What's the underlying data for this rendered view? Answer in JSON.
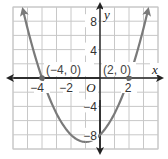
{
  "chart_data": {
    "type": "line",
    "title": "",
    "xlabel": "x",
    "ylabel": "y",
    "xlim": [
      -6,
      4
    ],
    "ylim": [
      -10,
      10
    ],
    "grid": true,
    "grid_step": {
      "x": 1,
      "y": 2
    },
    "x_ticks": [
      {
        "value": -4,
        "label": "−4"
      },
      {
        "value": -2,
        "label": "−2"
      },
      {
        "value": 2,
        "label": "2"
      }
    ],
    "y_ticks": [
      {
        "value": 8,
        "label": "8"
      },
      {
        "value": 4,
        "label": "4"
      },
      {
        "value": -4,
        "label": "−4"
      },
      {
        "value": -8,
        "label": "−8"
      }
    ],
    "origin_label": "O",
    "series": [
      {
        "name": "parabola",
        "equation": "y = x^2 + 2x - 8",
        "coefficients": {
          "a": 1,
          "b": 2,
          "c": -8
        },
        "vertex": [
          -1,
          -9
        ],
        "color": "#7a7a7a"
      }
    ],
    "annotations": [
      {
        "point": [
          -4,
          0
        ],
        "label": "(−4, 0)"
      },
      {
        "point": [
          2,
          0
        ],
        "label": "(2, 0)"
      }
    ],
    "colors": {
      "grid": "#c8c8c8",
      "axis": "#222222",
      "curve": "#7a7a7a",
      "point": "#6a6a6a"
    }
  }
}
